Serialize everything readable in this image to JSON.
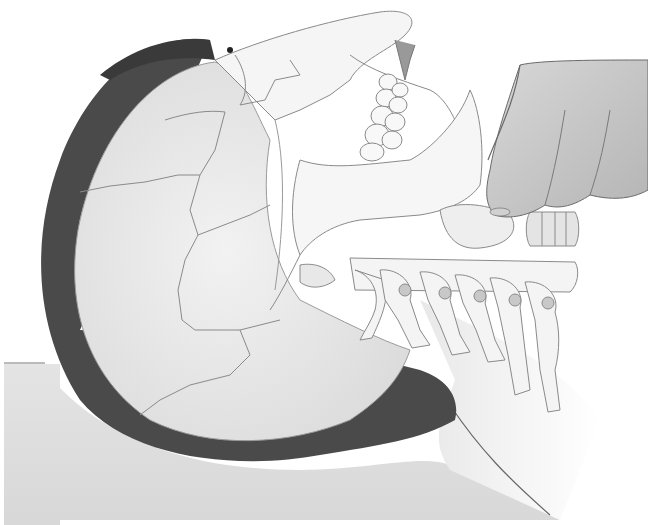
{
  "illustration": {
    "subject": "Head-tilt / neck palpation illustration with skull and cervical spine overlay",
    "alt": "Grayscale illustration of a supine head showing skull and cervical vertebrae, with fingers pressing on the neck",
    "colors": {
      "background": "#ffffff",
      "surface": "#e6e6e6",
      "hair": "#4a4a4a",
      "skull_fill": "#eeeeee",
      "bone_line": "#8a8a8a",
      "hand": "#c8c8c8",
      "shadow": "#3a3a3a"
    },
    "elements": [
      "surface",
      "hair",
      "skull",
      "teeth",
      "mandible",
      "cervical-spine",
      "hand"
    ]
  }
}
